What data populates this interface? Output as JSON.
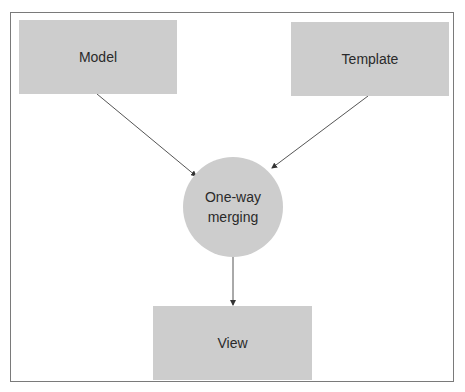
{
  "diagram": {
    "nodes": {
      "model": {
        "label": "Model"
      },
      "template": {
        "label": "Template"
      },
      "merge": {
        "line1": "One-way",
        "line2": "merging"
      },
      "view": {
        "label": "View"
      }
    },
    "edges": [
      {
        "from": "Model",
        "to": "One-way merging"
      },
      {
        "from": "Template",
        "to": "One-way merging"
      },
      {
        "from": "One-way merging",
        "to": "View"
      }
    ],
    "colors": {
      "node_fill": "#cdcdcd",
      "line": "#555555",
      "border": "#7a7a7a"
    }
  }
}
